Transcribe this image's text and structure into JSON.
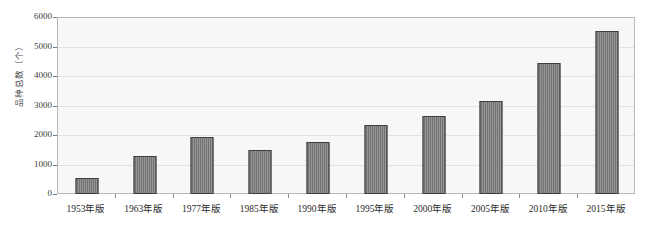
{
  "chart_data": {
    "type": "bar",
    "title": "",
    "xlabel": "",
    "ylabel": "品种总数（个）",
    "categories": [
      "1953年版",
      "1963年版",
      "1977年版",
      "1985年版",
      "1990年版",
      "1995年版",
      "2000年版",
      "2005年版",
      "2010年版",
      "2015年版"
    ],
    "values": [
      550,
      1300,
      1950,
      1500,
      1780,
      2350,
      2650,
      3180,
      4460,
      5550
    ],
    "ylim": [
      0,
      6000
    ],
    "yticks": [
      0,
      1000,
      2000,
      3000,
      4000,
      5000,
      6000
    ],
    "ytick_labels": [
      "0",
      "1000",
      "2000",
      "3000",
      "4000",
      "5000",
      "6000"
    ],
    "grid": true,
    "legend": false,
    "colors": {
      "bar_fill": "#787878",
      "bar_border": "#3f3f3f",
      "plot_background": "#f7f7f7",
      "gridline": "#e2e2e2",
      "frame": "#b8b8b8",
      "text": "#2b2b2b"
    }
  }
}
